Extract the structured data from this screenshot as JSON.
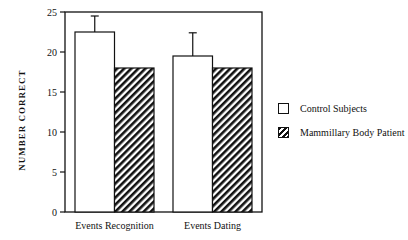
{
  "chart_data": {
    "type": "bar",
    "title": "",
    "xlabel": "",
    "ylabel": "NUMBER CORRECT",
    "categories": [
      "Events Recognition",
      "Events Dating"
    ],
    "series": [
      {
        "name": "Control Subjects",
        "values": [
          22.5,
          19.5
        ],
        "error": [
          2.0,
          2.9
        ],
        "fill": "white"
      },
      {
        "name": "Mammillary Body Patient",
        "values": [
          18,
          18
        ],
        "fill": "hatched"
      }
    ],
    "ylim": [
      0,
      25
    ],
    "yticks": [
      0,
      5,
      10,
      15,
      20,
      25
    ],
    "grid": false,
    "legend_position": "right"
  },
  "legend": {
    "items": [
      {
        "label": "Control Subjects"
      },
      {
        "label": "Mammillary Body Patient"
      }
    ]
  }
}
